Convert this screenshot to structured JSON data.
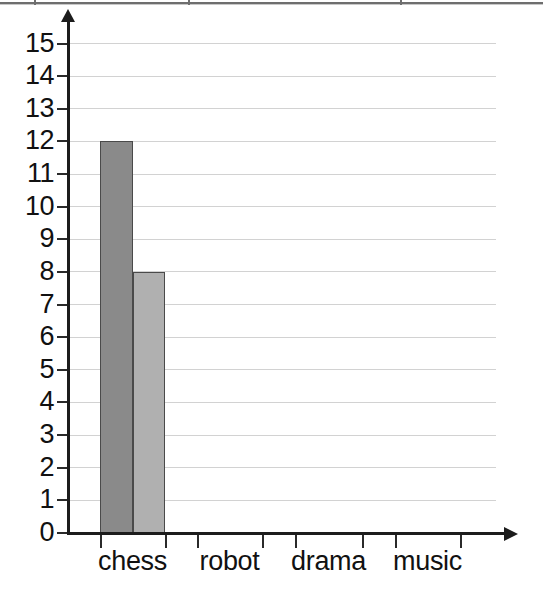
{
  "page": {
    "background_color": "#ffffff",
    "width": 543,
    "height": 597
  },
  "top_border": {
    "name": "cut-off-table-border",
    "color": "#6e6e6e"
  },
  "chart_data": {
    "type": "bar",
    "title": "",
    "subtitle": "",
    "xlabel": "",
    "ylabel": "",
    "categories": [
      "chess",
      "robot",
      "drama",
      "music"
    ],
    "series": [
      {
        "name": "series-1",
        "color": "#8a8a8a",
        "values": [
          12,
          0,
          0,
          0
        ]
      },
      {
        "name": "series-2",
        "color": "#b0b0b0",
        "values": [
          8,
          0,
          0,
          0
        ]
      }
    ],
    "ylim": [
      0,
      15
    ],
    "ytick_labels": [
      "0",
      "1",
      "2",
      "3",
      "4",
      "5",
      "6",
      "7",
      "8",
      "9",
      "10",
      "11",
      "12",
      "13",
      "14",
      "15"
    ],
    "ytick_values": [
      0,
      1,
      2,
      3,
      4,
      5,
      6,
      7,
      8,
      9,
      10,
      11,
      12,
      13,
      14,
      15
    ],
    "grid": true,
    "grid_color": "#d2d2d2",
    "legend": "none",
    "axis_color": "#1c1c1c",
    "bar_border_color": "#4a4a4a",
    "annotations": []
  },
  "axes": {
    "y_axis_name": "y-axis",
    "x_axis_name": "x-axis",
    "y_arrow_icon": "arrow-up-icon",
    "x_arrow_icon": "arrow-right-icon"
  }
}
